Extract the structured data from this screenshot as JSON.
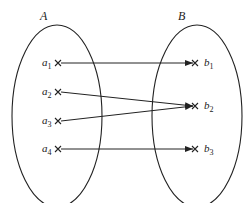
{
  "diagram": {
    "type": "mapping",
    "sets": [
      {
        "name": "A",
        "cx": 57,
        "cy": 116,
        "rx": 45,
        "ry": 91,
        "label_x": 40,
        "label_y": 20
      },
      {
        "name": "B",
        "cx": 197,
        "cy": 116,
        "rx": 45,
        "ry": 91,
        "label_x": 178,
        "label_y": 20
      }
    ],
    "domain_elements": [
      {
        "base": "a",
        "sub": "1",
        "x": 58,
        "y": 63
      },
      {
        "base": "a",
        "sub": "2",
        "x": 58,
        "y": 92
      },
      {
        "base": "a",
        "sub": "3",
        "x": 58,
        "y": 121
      },
      {
        "base": "a",
        "sub": "4",
        "x": 58,
        "y": 149
      }
    ],
    "codomain_elements": [
      {
        "base": "b",
        "sub": "1",
        "x": 195,
        "y": 63
      },
      {
        "base": "b",
        "sub": "2",
        "x": 195,
        "y": 106
      },
      {
        "base": "b",
        "sub": "3",
        "x": 195,
        "y": 149
      }
    ],
    "mappings": [
      {
        "from": "a1",
        "to": "b1"
      },
      {
        "from": "a2",
        "to": "b2"
      },
      {
        "from": "a3",
        "to": "b2"
      },
      {
        "from": "a4",
        "to": "b3"
      }
    ],
    "colors": {
      "stroke": "#222222"
    }
  }
}
